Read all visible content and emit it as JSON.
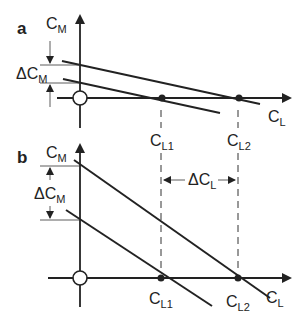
{
  "figure": {
    "panels": [
      {
        "id": "a",
        "label": "a",
        "y_axis": {
          "symbol": "C",
          "sub": "M"
        },
        "x_axis": {
          "symbol": "C",
          "sub": "L"
        },
        "delta_label": {
          "symbol": "ΔC",
          "sub": "M"
        },
        "points": [
          {
            "symbol": "C",
            "sub": "L1"
          },
          {
            "symbol": "C",
            "sub": "L2"
          }
        ]
      },
      {
        "id": "b",
        "label": "b",
        "y_axis": {
          "symbol": "C",
          "sub": "M"
        },
        "x_axis": {
          "symbol": "C",
          "sub": "L"
        },
        "delta_label": {
          "symbol": "ΔC",
          "sub": "M"
        },
        "points": [
          {
            "symbol": "C",
            "sub": "L1"
          },
          {
            "symbol": "C",
            "sub": "L2"
          }
        ]
      }
    ],
    "delta_cl": {
      "symbol": "ΔC",
      "sub": "L"
    },
    "colors": {
      "ink": "#222222",
      "background": "#ffffff"
    }
  }
}
